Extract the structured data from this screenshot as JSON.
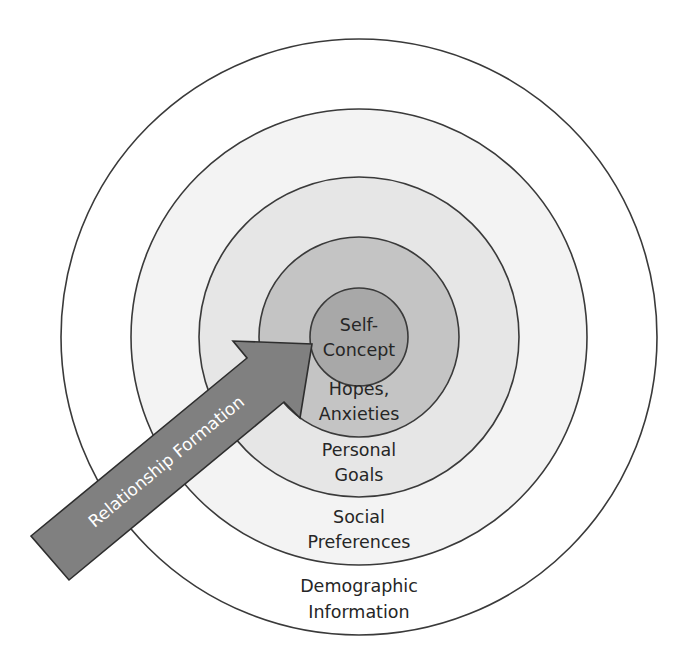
{
  "diagram": {
    "type": "concentric-circles",
    "center": [
      359,
      337
    ],
    "colors": {
      "ring_stroke": "#3a3a3a",
      "text": "#262626",
      "arrow_fill": "#808080",
      "arrow_stroke": "#2e2e2e",
      "arrow_text": "#ffffff"
    },
    "layers": [
      {
        "id": "demographic",
        "r": 298,
        "fill": "#ffffff",
        "lines": [
          "Demographic",
          "Information"
        ],
        "label_y": [
          592,
          618
        ]
      },
      {
        "id": "social",
        "r": 228,
        "fill": "#f3f3f3",
        "lines": [
          "Social",
          "Preferences"
        ],
        "label_y": [
          523,
          548
        ]
      },
      {
        "id": "goals",
        "r": 160,
        "fill": "#e6e6e6",
        "lines": [
          "Personal",
          "Goals"
        ],
        "label_y": [
          456,
          481
        ]
      },
      {
        "id": "hopes",
        "r": 100,
        "fill": "#c4c4c4",
        "lines": [
          "Hopes,",
          "Anxieties"
        ],
        "label_y": [
          395,
          420
        ]
      },
      {
        "id": "self",
        "r": 49,
        "fill": "#a8a8a8",
        "lines": [
          "Self-",
          "Concept"
        ],
        "label_y": [
          331,
          356
        ]
      }
    ],
    "arrow": {
      "label": "Relationship Formation",
      "points": "31,536 247,358 233,341 312,344 300,418 284,402 69,580",
      "label_x": 170,
      "label_y": 466,
      "angle": -39.5
    }
  }
}
